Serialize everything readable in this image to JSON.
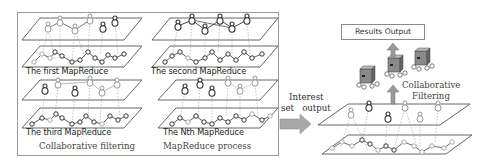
{
  "diagram": {
    "left_panel": {
      "caption_left": "Collaborative filtering",
      "caption_right": "MapReduce process",
      "rounds": [
        {
          "label": "The first MapReduce"
        },
        {
          "label": "The second MapReduce"
        },
        {
          "label": "The third MapReduce"
        },
        {
          "label": "The Nth MapReduce"
        }
      ]
    },
    "arrow_label": {
      "line1": "Interest",
      "line2": "set   output"
    },
    "right_panel": {
      "results_box": "Results Output",
      "cf_label_line1": "Collaborative",
      "cf_label_line2": "Filtering",
      "servers": 3
    },
    "colors": {
      "border": "#9a9a9a",
      "arrow": "#a8a8a8",
      "plane": "#555555",
      "node_dark": "#333333",
      "node_light": "#b0b0b0"
    }
  }
}
